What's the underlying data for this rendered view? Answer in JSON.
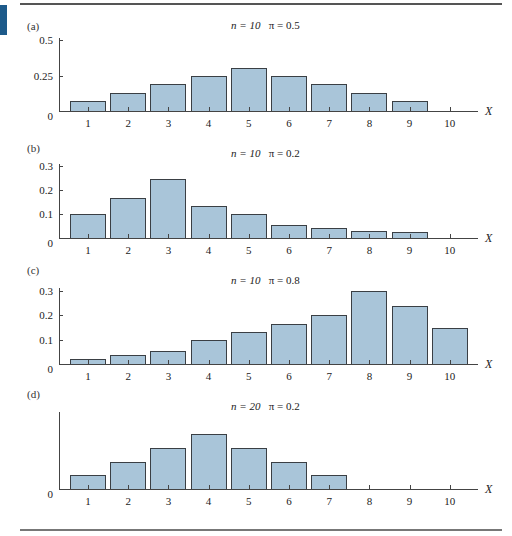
{
  "page": {
    "accent_color": "#1d5a8a",
    "bar_color": "#a9c5d9",
    "bar_border_color": "#3a3f44"
  },
  "chart_data": [
    {
      "type": "bar",
      "panel_label": "(a)",
      "title_n": "n = 10",
      "title_pi": "π = 0.5",
      "title": "n = 10   π = 0.5",
      "xlabel": "X",
      "ylabel": "",
      "categories": [
        "1",
        "2",
        "3",
        "4",
        "5",
        "6",
        "7",
        "8",
        "9",
        "10"
      ],
      "values": [
        0.07,
        0.13,
        0.19,
        0.25,
        0.3,
        0.25,
        0.19,
        0.13,
        0.07,
        0.0
      ],
      "yticks": [
        {
          "value": 0,
          "label": "0"
        },
        {
          "value": 0.25,
          "label": "0.25"
        },
        {
          "value": 0.5,
          "label": "0.5"
        }
      ],
      "ylim": [
        0,
        0.5
      ],
      "grid": false,
      "layout": {
        "label_y": 20,
        "title_y": 19,
        "axis_top": 38,
        "baseline": 111,
        "ytop_value": 0.5,
        "ytop_px": 40
      }
    },
    {
      "type": "bar",
      "panel_label": "(b)",
      "title_n": "n = 10",
      "title_pi": "π = 0.2",
      "title": "n = 10   π = 0.2",
      "xlabel": "X",
      "ylabel": "",
      "categories": [
        "1",
        "2",
        "3",
        "4",
        "5",
        "6",
        "7",
        "8",
        "9",
        "10"
      ],
      "values": [
        0.1,
        0.165,
        0.245,
        0.135,
        0.1,
        0.055,
        0.04,
        0.03,
        0.025,
        0.0
      ],
      "yticks": [
        {
          "value": 0,
          "label": "0"
        },
        {
          "value": 0.1,
          "label": "0.1"
        },
        {
          "value": 0.2,
          "label": "0.2"
        },
        {
          "value": 0.3,
          "label": "0.3"
        }
      ],
      "ylim": [
        0,
        0.3
      ],
      "grid": false,
      "layout": {
        "label_y": 142,
        "title_y": 147,
        "axis_top": 164,
        "baseline": 238,
        "ytop_value": 0.3,
        "ytop_px": 166
      }
    },
    {
      "type": "bar",
      "panel_label": "(c)",
      "title_n": "n = 10",
      "title_pi": "π = 0.8",
      "title": "n = 10   π = 0.8",
      "xlabel": "X",
      "ylabel": "",
      "categories": [
        "1",
        "2",
        "3",
        "4",
        "5",
        "6",
        "7",
        "8",
        "9",
        "10"
      ],
      "values": [
        0.02,
        0.035,
        0.055,
        0.1,
        0.13,
        0.165,
        0.2,
        0.3,
        0.24,
        0.15
      ],
      "yticks": [
        {
          "value": 0,
          "label": "0"
        },
        {
          "value": 0.1,
          "label": "0.1"
        },
        {
          "value": 0.2,
          "label": "0.2"
        },
        {
          "value": 0.3,
          "label": "0.3"
        }
      ],
      "ylim": [
        0,
        0.3
      ],
      "grid": false,
      "layout": {
        "label_y": 264,
        "title_y": 274,
        "axis_top": 288,
        "baseline": 364,
        "ytop_value": 0.3,
        "ytop_px": 291
      }
    },
    {
      "type": "bar",
      "panel_label": "(d)",
      "title_n": "n = 20",
      "title_pi": "π = 0.2",
      "title": "n = 20   π = 0.2",
      "xlabel": "X",
      "ylabel": "",
      "categories": [
        "1",
        "2",
        "3",
        "4",
        "5",
        "6",
        "7",
        "8",
        "9",
        "10"
      ],
      "values": [
        0.055,
        0.11,
        0.165,
        0.22,
        0.165,
        0.11,
        0.055,
        0.0,
        0.0,
        0.0
      ],
      "yticks": [
        {
          "value": 0,
          "label": "0"
        }
      ],
      "ylim": [
        0,
        0.31
      ],
      "grid": false,
      "layout": {
        "label_y": 388,
        "title_y": 400,
        "axis_top": 412,
        "baseline": 489,
        "ytop_value": 0.31,
        "ytop_px": 412
      }
    }
  ]
}
